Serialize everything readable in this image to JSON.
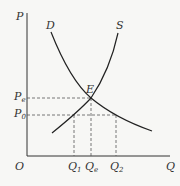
{
  "diagram": {
    "type": "supply-demand",
    "axes": {
      "y_label": "P",
      "x_label": "Q",
      "origin_label": "O"
    },
    "curves": [
      {
        "name": "demand",
        "label": "D"
      },
      {
        "name": "supply",
        "label": "S"
      }
    ],
    "equilibrium": {
      "label": "E"
    },
    "price_levels": [
      {
        "main": "P",
        "sub": "e"
      },
      {
        "main": "P",
        "sub": "0"
      }
    ],
    "quantity_levels": [
      {
        "main": "Q",
        "sub": "1"
      },
      {
        "main": "Q",
        "sub": "e"
      },
      {
        "main": "Q",
        "sub": "2"
      }
    ],
    "colors": {
      "line": "#222222",
      "dashed": "#555555",
      "text": "#333333"
    }
  }
}
